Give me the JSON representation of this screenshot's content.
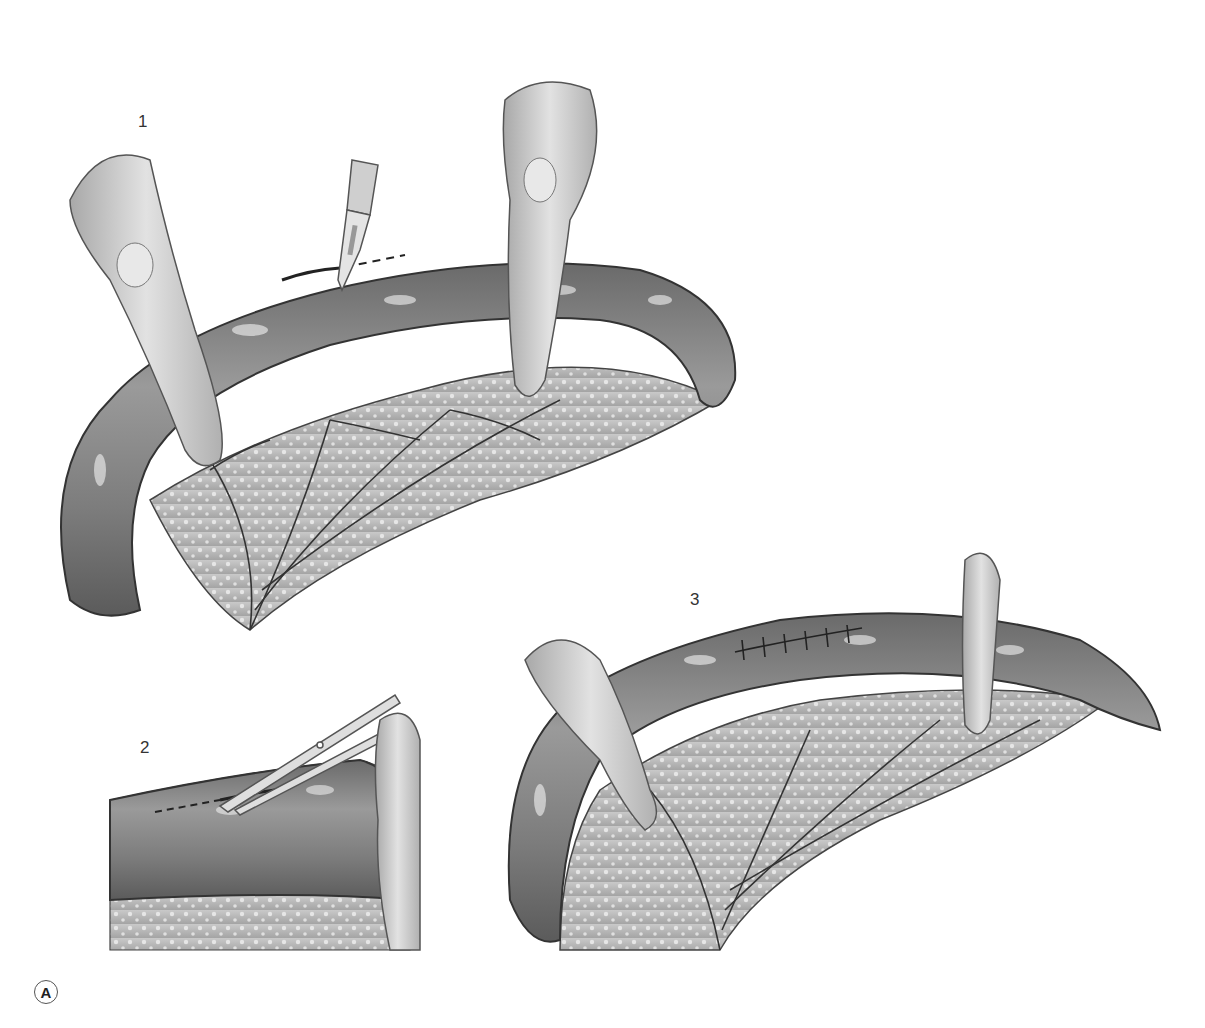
{
  "figure": {
    "badge": "A",
    "steps": [
      {
        "number": "1",
        "instrument": "scalpel",
        "action": "incision along dashed line"
      },
      {
        "number": "2",
        "instrument": "scissors",
        "action": "extend cut along dashed line"
      },
      {
        "number": "3",
        "instrument": "sutures",
        "action": "closed incision with interrupted sutures",
        "suture_count": 6
      }
    ]
  },
  "colors": {
    "tissue_dark": "#5a5a5a",
    "tissue_mid": "#8d8d8d",
    "tissue_light": "#d6d6d6",
    "finger": "#c8c8c8",
    "mesentery": "#b8b8b8",
    "vessel": "#3a3a3a"
  }
}
